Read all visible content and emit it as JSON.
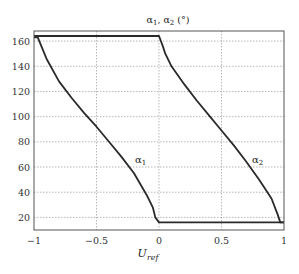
{
  "chart_data": {
    "type": "line",
    "title": "α1, α2 (°)",
    "xlabel": "U_ref",
    "ylabel": "",
    "xlim": [
      -1,
      1
    ],
    "ylim": [
      10,
      168
    ],
    "grid": true,
    "legend": "inline labels",
    "x_ticks": [
      "-1",
      "-0.5",
      "0",
      "0.5",
      "1"
    ],
    "y_ticks": [
      "20",
      "40",
      "60",
      "80",
      "100",
      "120",
      "140",
      "160"
    ],
    "series": [
      {
        "name": "α1",
        "x": [
          -1.0,
          -0.97,
          -0.95,
          -0.9,
          -0.8,
          -0.7,
          -0.6,
          -0.5,
          -0.4,
          -0.3,
          -0.2,
          -0.1,
          -0.05,
          -0.03,
          0.0,
          0.5,
          1.0
        ],
        "y": [
          163,
          163,
          158,
          146,
          128,
          115,
          103,
          92,
          80,
          68,
          55,
          38,
          28,
          20,
          16,
          16,
          16
        ]
      },
      {
        "name": "α2",
        "x": [
          -1.0,
          -0.5,
          0.0,
          0.03,
          0.05,
          0.1,
          0.2,
          0.3,
          0.4,
          0.5,
          0.6,
          0.7,
          0.8,
          0.9,
          0.95,
          0.97,
          1.0
        ],
        "y": [
          164,
          164,
          164,
          156,
          150,
          140,
          126,
          113,
          101,
          89,
          77,
          64,
          50,
          35,
          22,
          16,
          16
        ]
      }
    ],
    "annotations": [
      {
        "text": "α1",
        "x": -0.13,
        "y": 68
      },
      {
        "text": "α2",
        "x": 0.76,
        "y": 67
      }
    ]
  },
  "labels": {
    "title_main": "α",
    "title_sub1": "1",
    "title_mid": ", α",
    "title_sub2": "2",
    "title_unit": " (°)",
    "xlabel_main": "U",
    "xlabel_sub": "ref",
    "alpha1_main": "α",
    "alpha1_sub": "1",
    "alpha2_main": "α",
    "alpha2_sub": "2"
  }
}
